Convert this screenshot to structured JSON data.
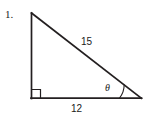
{
  "figure": {
    "problem_number": "1.",
    "type": "right-triangle-trigonometry-diagram",
    "stroke_color": "#231f20",
    "background_color": "#ffffff",
    "vertices": {
      "apex": {
        "x": 31,
        "y": 13
      },
      "right_angle": {
        "x": 31,
        "y": 98
      },
      "angle_theta": {
        "x": 141,
        "y": 98
      }
    },
    "sides": {
      "hypotenuse_label": "15",
      "base_label": "12",
      "vertical_label": ""
    },
    "angle": {
      "symbol": "θ",
      "marker": "arc",
      "arc_radius": 22
    },
    "right_angle_marker": {
      "type": "square",
      "size": 8
    }
  }
}
